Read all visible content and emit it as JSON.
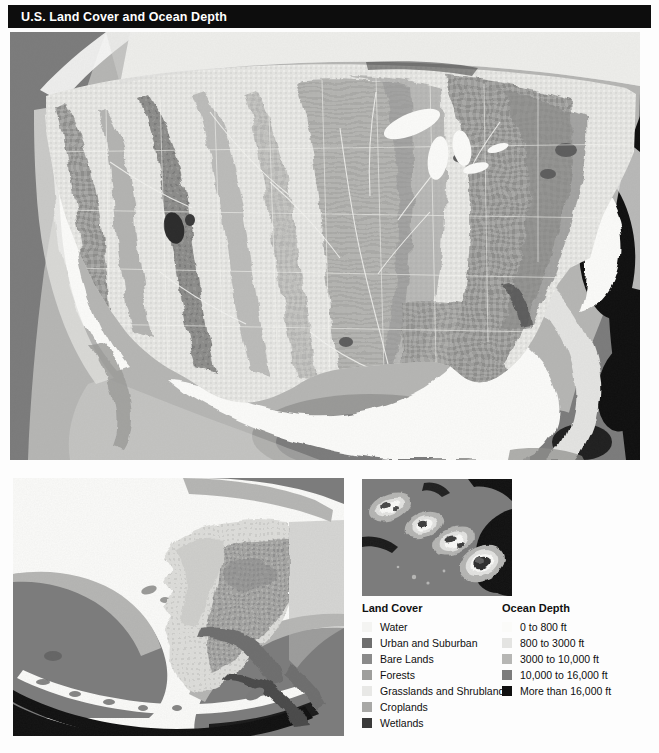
{
  "header": {
    "title": "U.S. Land Cover and Ocean Depth"
  },
  "maps": {
    "main": {
      "name": "conterminous-united-states-map"
    },
    "alaska": {
      "name": "alaska-map"
    },
    "hawaii": {
      "name": "hawaii-map"
    }
  },
  "legend": {
    "land_cover": {
      "title": "Land Cover",
      "items": [
        {
          "label": "Water",
          "color": "#f4f4f2"
        },
        {
          "label": "Urban and Suburban",
          "color": "#6e6e6e"
        },
        {
          "label": "Bare Lands",
          "color": "#8a8a8a"
        },
        {
          "label": "Forests",
          "color": "#9e9e9c"
        },
        {
          "label": "Grasslands and Shrublands",
          "color": "#e8e8e6"
        },
        {
          "label": "Croplands",
          "color": "#a8a8a6"
        },
        {
          "label": "Wetlands",
          "color": "#3a3a3a"
        }
      ]
    },
    "ocean_depth": {
      "title": "Ocean Depth",
      "items": [
        {
          "label": "0 to 800 ft",
          "color": "#fbfbf9"
        },
        {
          "label": "800 to 3000 ft",
          "color": "#e4e4e2"
        },
        {
          "label": "3000 to 10,000 ft",
          "color": "#b6b6b4"
        },
        {
          "label": "10,000 to 16,000 ft",
          "color": "#7c7c7c"
        },
        {
          "label": "More than 16,000 ft",
          "color": "#101010"
        }
      ]
    }
  },
  "colors": {
    "page_background": "#fdfdfd",
    "title_bar": "#0d0d0d",
    "title_text": "#ffffff",
    "ocean_shelf": "#fbfbf9",
    "ocean_shallow": "#e4e4e2",
    "ocean_mid": "#b6b6b4",
    "ocean_deep": "#7c7c7c",
    "ocean_abyss": "#101010",
    "land_grass": "#e8e8e6",
    "land_forest": "#9e9e9c",
    "land_crop": "#a8a8a6",
    "land_bare": "#8a8a8a",
    "land_urban": "#6e6e6e",
    "land_wetland": "#3a3a3a",
    "lake_water": "#f4f4f2"
  }
}
